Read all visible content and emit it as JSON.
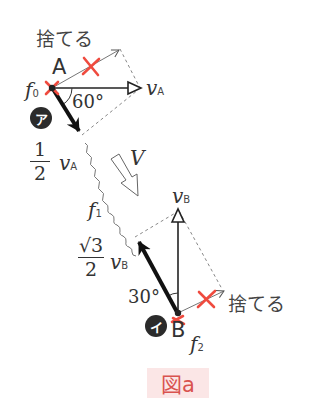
{
  "figure": {
    "caption": "図a",
    "discard_label_top": "捨てる",
    "discard_label_bottom": "捨てる",
    "point_a": "A",
    "point_b": "B",
    "photon_f0": "f",
    "photon_f0_sub": "0",
    "photon_f1": "f",
    "photon_f1_sub": "1",
    "photon_f2": "f",
    "photon_f2_sub": "2",
    "velocity_a": "v",
    "velocity_a_sub": "A",
    "velocity_b": "v",
    "velocity_b_sub": "B",
    "velocity_big": "V",
    "angle_a": "60°",
    "angle_b": "30°",
    "half_numerator": "1",
    "half_denominator": "2",
    "half_var": "v",
    "half_var_sub": "A",
    "sqrt3_numerator": "√3",
    "sqrt3_denominator": "2",
    "sqrt3_var": "v",
    "sqrt3_var_sub": "B",
    "badge_a": "ア",
    "badge_b": "イ"
  },
  "colors": {
    "cross": "#ef4b3f",
    "caption_bg": "#fbe6e6",
    "caption_text": "#d9534f",
    "lines": "#222222",
    "dashed": "#888888"
  }
}
